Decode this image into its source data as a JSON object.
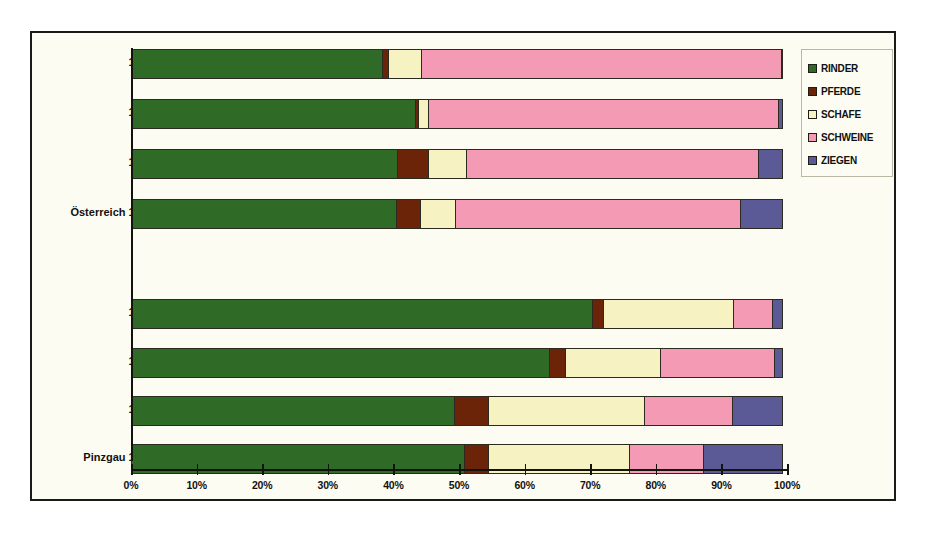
{
  "chart_data": {
    "type": "bar",
    "orientation": "horizontal",
    "stacked": true,
    "normalized": true,
    "title": "",
    "xlabel": "",
    "ylabel": "",
    "xlim": [
      0,
      100
    ],
    "xticks": [
      "0%",
      "10%",
      "20%",
      "30%",
      "40%",
      "50%",
      "60%",
      "70%",
      "80%",
      "90%",
      "100%"
    ],
    "grid": false,
    "legend_position": "right",
    "legend": [
      "RINDER",
      "PFERDE",
      "SCHAFE",
      "SCHWEINE",
      "ZIEGEN"
    ],
    "colors": [
      "#2f6b26",
      "#6b2408",
      "#f7f2c2",
      "#f49ab5",
      "#5b5a96"
    ],
    "categories": [
      "1991",
      "1971",
      "1951",
      "Österreich 1938",
      "1991",
      "1971",
      "1951",
      "Pinzgau 1938"
    ],
    "series": [
      {
        "name": "RINDER",
        "values": [
          38.4,
          43.4,
          40.7,
          40.5,
          70.4,
          63.9,
          49.4,
          50.9
        ]
      },
      {
        "name": "PFERDE",
        "values": [
          1.1,
          0.6,
          4.9,
          3.8,
          1.8,
          2.6,
          5.3,
          3.8
        ]
      },
      {
        "name": "SCHAFE",
        "values": [
          5.2,
          1.8,
          5.9,
          5.5,
          20.0,
          14.6,
          23.9,
          21.7
        ]
      },
      {
        "name": "SCHWEINE",
        "values": [
          55.0,
          53.5,
          44.7,
          43.7,
          6.1,
          17.5,
          13.7,
          11.4
        ]
      },
      {
        "name": "ZIEGEN",
        "values": [
          0.3,
          0.7,
          3.8,
          6.5,
          1.7,
          1.4,
          7.7,
          12.2
        ]
      }
    ]
  },
  "legend": {
    "items": [
      {
        "label": "RINDER",
        "color": "#2f6b26",
        "icon": "legend-swatch-icon"
      },
      {
        "label": "PFERDE",
        "color": "#6b2408",
        "icon": "legend-swatch-icon"
      },
      {
        "label": "SCHAFE",
        "color": "#f7f2c2",
        "icon": "legend-swatch-icon"
      },
      {
        "label": "SCHWEINE",
        "color": "#f49ab5",
        "icon": "legend-swatch-icon"
      },
      {
        "label": "ZIEGEN",
        "color": "#5b5a96",
        "icon": "legend-swatch-icon"
      }
    ]
  },
  "axis": {
    "ticks": [
      {
        "label": "0%",
        "value": 0
      },
      {
        "label": "10%",
        "value": 10
      },
      {
        "label": "20%",
        "value": 20
      },
      {
        "label": "30%",
        "value": 30
      },
      {
        "label": "40%",
        "value": 40
      },
      {
        "label": "50%",
        "value": 50
      },
      {
        "label": "60%",
        "value": 60
      },
      {
        "label": "70%",
        "value": 70
      },
      {
        "label": "80%",
        "value": 80
      },
      {
        "label": "90%",
        "value": 90
      },
      {
        "label": "100%",
        "value": 100
      }
    ]
  },
  "rows": [
    {
      "label": "1991",
      "top": 0,
      "group": "oesterreich"
    },
    {
      "label": "1971",
      "top": 50,
      "group": "oesterreich"
    },
    {
      "label": "1951",
      "top": 100,
      "group": "oesterreich"
    },
    {
      "label": "Österreich 1938",
      "top": 150,
      "group": "oesterreich"
    },
    {
      "label": "1991",
      "top": 250,
      "group": "pinzgau"
    },
    {
      "label": "1971",
      "top": 299,
      "group": "pinzgau"
    },
    {
      "label": "1951",
      "top": 347,
      "group": "pinzgau"
    },
    {
      "label": "Pinzgau 1938",
      "top": 395,
      "group": "pinzgau"
    }
  ]
}
